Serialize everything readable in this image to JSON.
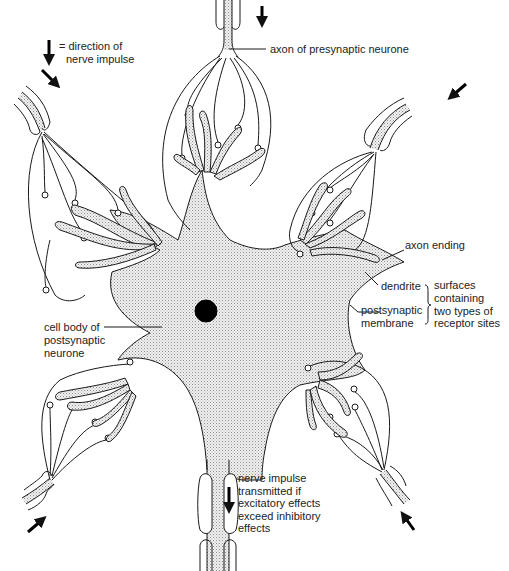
{
  "diagram": {
    "colors": {
      "line": "#1a1a1a",
      "fill_stipple": "#d9d9d9",
      "nucleus": "#000000",
      "background": "#ffffff"
    },
    "legend": {
      "arrow_icon": "down-arrow-icon",
      "text_line1": "= direction of",
      "text_line2": "nerve impulse"
    },
    "labels": {
      "presynaptic_axon": "axon of presynaptic neurone",
      "axon_ending": "axon ending",
      "dendrite": "dendrite",
      "postsynaptic_membrane_line1": "postsynaptic",
      "postsynaptic_membrane_line2": "membrane",
      "receptor_note_line1": "surfaces",
      "receptor_note_line2": "containing",
      "receptor_note_line3": "two types of",
      "receptor_note_line4": "receptor sites",
      "cell_body_line1": "cell body of",
      "cell_body_line2": "postsynaptic",
      "cell_body_line3": "neurone",
      "output_line1": "nerve impulse",
      "output_line2": "transmitted if",
      "output_line3": "excitatory effects",
      "output_line4": "exceed inhibitory",
      "output_line5": "effects"
    },
    "presynaptic_inputs": [
      "top",
      "top-left",
      "top-right",
      "bottom-left",
      "bottom-right"
    ],
    "impulse_arrows": [
      "legend",
      "top",
      "top-left",
      "top-right",
      "bottom-left",
      "bottom-right",
      "output-axon"
    ]
  }
}
